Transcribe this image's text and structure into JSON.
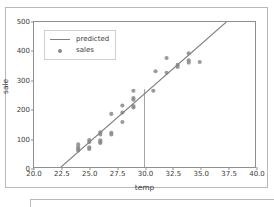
{
  "chart_data": {
    "type": "scatter",
    "title": "",
    "xlabel": "temp",
    "ylabel": "sale",
    "xlim": [
      20.0,
      40.0
    ],
    "ylim": [
      0,
      500
    ],
    "xticks": [
      "20.0",
      "22.5",
      "25.0",
      "27.5",
      "30.0",
      "32.5",
      "35.0",
      "37.5",
      "40.0"
    ],
    "xtick_values": [
      20.0,
      22.5,
      25.0,
      27.5,
      30.0,
      32.5,
      35.0,
      37.5,
      40.0
    ],
    "yticks": [
      "0",
      "100",
      "200",
      "300",
      "400",
      "500"
    ],
    "ytick_values": [
      0,
      100,
      200,
      300,
      400,
      500
    ],
    "grid": false,
    "legend_position": "upper left",
    "legend": [
      {
        "label": "predicted",
        "type": "line",
        "color": "#808080"
      },
      {
        "label": "sales",
        "type": "marker",
        "color": "#8a8a8a"
      }
    ],
    "series": [
      {
        "name": "sales",
        "type": "scatter",
        "color": "#8a8a8a",
        "marker": "o",
        "points": [
          [
            24.0,
            78
          ],
          [
            24.0,
            68
          ],
          [
            24.0,
            62
          ],
          [
            24.0,
            57
          ],
          [
            25.0,
            93
          ],
          [
            25.0,
            86
          ],
          [
            25.0,
            68
          ],
          [
            25.0,
            62
          ],
          [
            26.0,
            120
          ],
          [
            26.0,
            112
          ],
          [
            26.0,
            92
          ],
          [
            26.0,
            86
          ],
          [
            26.0,
            83
          ],
          [
            27.0,
            183
          ],
          [
            27.0,
            118
          ],
          [
            27.0,
            112
          ],
          [
            28.0,
            212
          ],
          [
            28.0,
            188
          ],
          [
            28.0,
            155
          ],
          [
            29.0,
            263
          ],
          [
            29.0,
            238
          ],
          [
            29.0,
            232
          ],
          [
            29.0,
            210
          ],
          [
            29.0,
            205
          ],
          [
            30.8,
            263
          ],
          [
            31.0,
            330
          ],
          [
            32.0,
            376
          ],
          [
            32.0,
            325
          ],
          [
            33.0,
            352
          ],
          [
            33.0,
            345
          ],
          [
            34.0,
            392
          ],
          [
            34.0,
            368
          ],
          [
            34.0,
            360
          ],
          [
            35.0,
            362
          ]
        ]
      },
      {
        "name": "predicted",
        "type": "line",
        "color": "#808080",
        "x": [
          22.45,
          37.4
        ],
        "y": [
          0,
          500
        ]
      }
    ],
    "annotations": [
      {
        "type": "vline",
        "name": "reference-line-temp-30",
        "x": 30.0,
        "y_from": 0,
        "y_to": 268,
        "color": "#9a9a9a"
      }
    ]
  },
  "axes": {
    "x_label": "temp",
    "y_label": "sale"
  }
}
